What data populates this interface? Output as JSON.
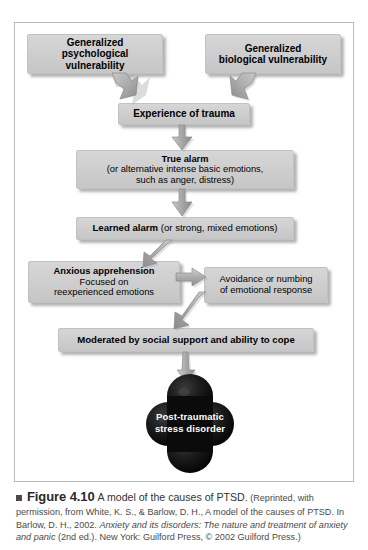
{
  "figure": {
    "frame_border_color": "#b9b9b9",
    "box_fill_color": "#cfcfcf",
    "arrow_fill_color": "#b0b0b0",
    "terminal_color": "#111111"
  },
  "nodes": {
    "psychological_vulnerability": {
      "line1": "Generalized",
      "line2": "psychological vulnerability"
    },
    "biological_vulnerability": {
      "line1": "Generalized",
      "line2": "biological vulnerability"
    },
    "experience_of_trauma": {
      "line1": "Experience of trauma"
    },
    "true_alarm": {
      "line1": "True alarm",
      "line2": "(or alternative intense basic emotions,",
      "line3": "such as anger, distress)"
    },
    "learned_alarm": {
      "bold": "Learned alarm",
      "rest": " (or strong, mixed emotions)"
    },
    "anxious_apprehension": {
      "line1": "Anxious apprehension",
      "line2": "Focused on",
      "line3": "reexperienced emotions"
    },
    "avoidance_numbing": {
      "line1": "Avoidance or numbing",
      "line2": "of emotional response"
    },
    "moderated_by_support": {
      "line1": "Moderated by social support and ability to cope"
    },
    "ptsd": {
      "line1": "Post-traumatic",
      "line2": "stress disorder"
    }
  },
  "caption": {
    "marker": "square-bullet",
    "figure_number": "Figure 4.10",
    "title": "A model of the causes of PTSD.",
    "credit_1": "(Reprinted,",
    "credit_2": "with permission, from White, K. S., & Barlow, D. H., A model of the causes of",
    "credit_3a": "PTSD. In Barlow, D. H., 2002. ",
    "credit_3b": "Anxiety and its disorders: The nature and treatment",
    "credit_4a": "of anxiety and panic",
    "credit_4b": " (2nd ed.). New York: Guilford Press, © 2002 Guilford Press.)"
  }
}
